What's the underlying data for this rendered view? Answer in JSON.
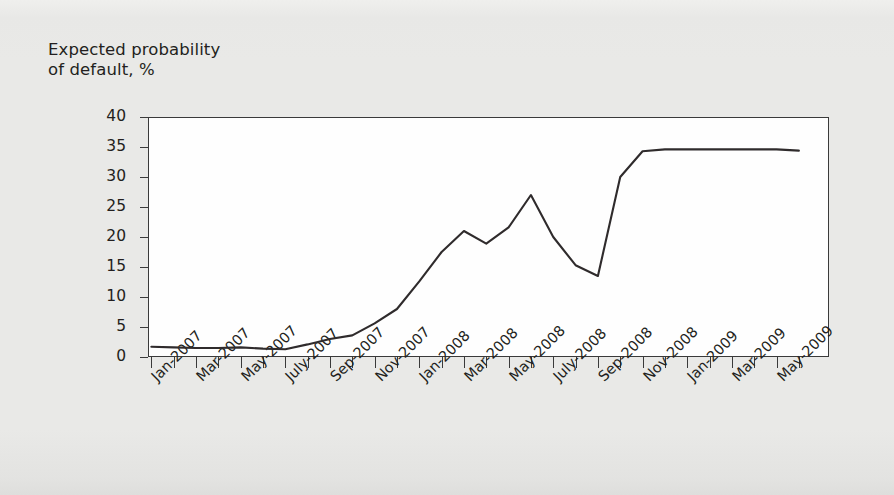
{
  "figure": {
    "background_color": "#e9e9e7",
    "plot_background_color": "#fefefe",
    "frame_color": "#3a3a3a",
    "line_color": "#2f2b2c"
  },
  "chart_data": {
    "type": "line",
    "title": "",
    "ylabel": "Expected probability\nof default, %",
    "xlabel": "",
    "ylim": [
      0,
      40
    ],
    "ytick_labels": [
      "0",
      "5",
      "10",
      "15",
      "20",
      "25",
      "30",
      "35",
      "40"
    ],
    "ytick_values": [
      0,
      5,
      10,
      15,
      20,
      25,
      30,
      35,
      40
    ],
    "grid": false,
    "legend": "none",
    "x": [
      "Jan-2007",
      "Feb-2007",
      "Mar-2007",
      "Apr-2007",
      "May-2007",
      "June-2007",
      "July-2007",
      "Aug-2007",
      "Sep-2007",
      "Oct-2007",
      "Nov-2007",
      "Dec-2007",
      "Jan-2008",
      "Feb-2008",
      "Mar-2008",
      "Apr-2008",
      "May-2008",
      "June-2008",
      "July-2008",
      "Aug-2008",
      "Sep-2008",
      "Oct-2008",
      "Nov-2008",
      "Dec-2008",
      "Jan-2009",
      "Feb-2009",
      "Mar-2009",
      "Apr-2009",
      "May-2009",
      "June-2009"
    ],
    "xtick_labels": [
      "Jan-2007",
      "Mar-2007",
      "May-2007",
      "July-2007",
      "Sep-2007",
      "Nov-2007",
      "Jan-2008",
      "Mar-2008",
      "May-2008",
      "July-2008",
      "Sep-2008",
      "Nov-2008",
      "Jan-2009",
      "Mar-2009",
      "May-2009"
    ],
    "xtick_label_indices": [
      0,
      2,
      4,
      6,
      8,
      10,
      12,
      14,
      16,
      18,
      20,
      22,
      24,
      26,
      28
    ],
    "values": [
      1.7,
      1.6,
      1.5,
      1.5,
      1.6,
      1.4,
      1.3,
      2.1,
      3.0,
      3.6,
      5.6,
      8.0,
      12.6,
      17.5,
      21.0,
      18.9,
      21.6,
      27.0,
      20.0,
      15.3,
      13.5,
      30.0,
      34.3,
      34.6,
      34.6,
      34.6,
      34.6,
      34.6,
      34.6,
      34.4
    ],
    "series": [
      {
        "name": "Expected probability of default",
        "values": [
          1.7,
          1.6,
          1.5,
          1.5,
          1.6,
          1.4,
          1.3,
          2.1,
          3.0,
          3.6,
          5.6,
          8.0,
          12.6,
          17.5,
          21.0,
          18.9,
          21.6,
          27.0,
          20.0,
          15.3,
          13.5,
          30.0,
          34.3,
          34.6,
          34.6,
          34.6,
          34.6,
          34.6,
          34.6,
          34.4
        ]
      }
    ]
  }
}
